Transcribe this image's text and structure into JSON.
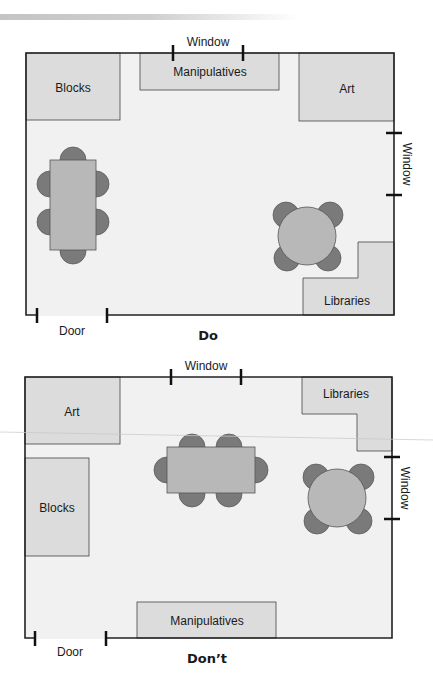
{
  "colors": {
    "floor": "#f1f1f1",
    "area": "#dcdcdc",
    "table": "#b8b8b8",
    "chair": "#7a7a7a",
    "wall": "#222222"
  },
  "do_plan": {
    "caption": "Do",
    "top_window_label": "Window",
    "right_window_label": "Window",
    "door_label": "Door",
    "areas": {
      "blocks": "Blocks",
      "manipulatives": "Manipulatives",
      "art": "Art",
      "libraries": "Libraries"
    }
  },
  "dont_plan": {
    "caption": "Don’t",
    "top_window_label": "Window",
    "right_window_label": "Window",
    "door_label": "Door",
    "areas": {
      "art": "Art",
      "libraries": "Libraries",
      "blocks": "Blocks",
      "manipulatives": "Manipulatives"
    }
  }
}
